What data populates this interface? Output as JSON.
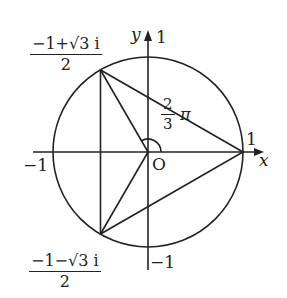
{
  "diagram": {
    "type": "unit-circle-complex-plane",
    "axes": {
      "x_label": "x",
      "y_label": "y",
      "origin_label": "O"
    },
    "ticks": {
      "x_pos": "1",
      "x_neg": "−1",
      "y_pos": "1",
      "y_neg": "−1"
    },
    "points": {
      "upper": {
        "num": "−1+√3 i",
        "den": "2"
      },
      "lower": {
        "num": "−1−√3 i",
        "den": "2"
      },
      "right": "1"
    },
    "angle": {
      "num": "2",
      "den": "3",
      "symbol": "π"
    },
    "colors": {
      "stroke": "#222222",
      "background": "#ffffff"
    }
  }
}
